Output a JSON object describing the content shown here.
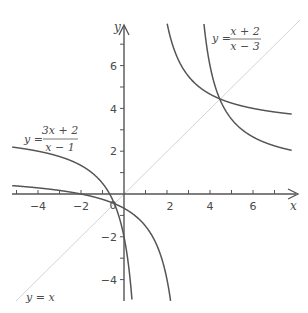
{
  "chart_data": {
    "type": "line",
    "title": "",
    "xlabel": "x",
    "ylabel": "y",
    "xlim": [
      -5.2,
      7.8
    ],
    "ylim": [
      -5,
      8.4
    ],
    "grid": false,
    "x_ticks": [
      -4,
      -2,
      0,
      2,
      4,
      6
    ],
    "x_minor_ticks": [
      -5,
      -3,
      -1,
      1,
      3,
      5,
      7
    ],
    "y_ticks": [
      -4,
      -2,
      2,
      4,
      6
    ],
    "y_minor_ticks": [
      -5,
      -3,
      -1,
      1,
      3,
      5,
      7
    ],
    "origin_label": "0",
    "series": [
      {
        "name": "y = (3x + 2)/(x − 1)",
        "function": "(3x+2)/(x-1)",
        "vertical_asymptote": 1,
        "horizontal_asymptote": 3,
        "points_left_branch": [
          [
            -5.2,
            2.19
          ],
          [
            -4,
            2.0
          ],
          [
            -2,
            1.33
          ],
          [
            -1,
            0.5
          ],
          [
            -0.667,
            0
          ],
          [
            0,
            -2
          ],
          [
            0.4,
            -5.33
          ]
        ],
        "points_right_branch": [
          [
            1.7,
            8.0
          ],
          [
            2,
            8
          ],
          [
            3,
            5.5
          ],
          [
            4,
            4.67
          ],
          [
            4.56,
            4.56
          ],
          [
            6,
            4.0
          ],
          [
            7.8,
            3.74
          ]
        ]
      },
      {
        "name": "y = (x + 2)/(x − 3)",
        "function": "(x+2)/(x-3)",
        "vertical_asymptote": 3,
        "horizontal_asymptote": 1,
        "points_left_branch": [
          [
            -5.2,
            0.39
          ],
          [
            -4,
            0.29
          ],
          [
            -2,
            0
          ],
          [
            0,
            -0.67
          ],
          [
            1,
            -1.5
          ],
          [
            2,
            -4
          ],
          [
            2.17,
            -5
          ]
        ],
        "points_right_branch": [
          [
            3.7,
            8.1
          ],
          [
            4,
            6
          ],
          [
            4.56,
            4.56
          ],
          [
            5,
            3.5
          ],
          [
            6,
            2.67
          ],
          [
            7.8,
            2.04
          ]
        ]
      },
      {
        "name": "y = x",
        "function": "x",
        "style": "thin light line"
      }
    ],
    "intersection_points": [
      [
        4.56,
        4.56
      ],
      [
        -0.56,
        -0.56
      ]
    ],
    "annotations": [
      {
        "text": "y = (x + 2)/(x − 3)",
        "position": "top-right"
      },
      {
        "text": "y = (3x + 2)/(x − 1)",
        "position": "left-middle"
      },
      {
        "text": "y = x",
        "position": "bottom-left"
      }
    ]
  },
  "labels": {
    "x_axis": "x",
    "y_axis": "y",
    "origin": "0",
    "eq1": {
      "lhs": "y =",
      "num": "x + 2",
      "den": "x − 3"
    },
    "eq2": {
      "lhs": "y =",
      "num": "3x + 2",
      "den": "x − 1"
    },
    "eq3": "y = x",
    "xticks": [
      "−4",
      "−2",
      "2",
      "4",
      "6"
    ],
    "yticks": [
      "6",
      "4",
      "2",
      "−2",
      "−4"
    ]
  },
  "colors": {
    "curve": "#555555",
    "axis": "#555555",
    "identity_line": "#c8c8c8",
    "text": "#4a4a4a"
  }
}
